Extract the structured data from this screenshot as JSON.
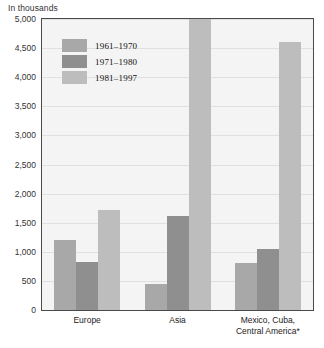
{
  "chart_data": {
    "type": "bar",
    "title": "In thousands",
    "xlabel": "",
    "ylabel": "In thousands",
    "ylim": [
      0,
      5000
    ],
    "ytick_labels": [
      "5,000",
      "4,500",
      "4,000",
      "3,500",
      "3,000",
      "2,500",
      "2,000",
      "1,500",
      "1,000",
      "500",
      "0"
    ],
    "ytick_values": [
      5000,
      4500,
      4000,
      3500,
      3000,
      2500,
      2000,
      1500,
      1000,
      500,
      0
    ],
    "grid": true,
    "legend_position": "upper-left-inside",
    "categories": [
      "Europe",
      "Asia",
      "Mexico, Cuba,\nCentral America*"
    ],
    "series": [
      {
        "name": "1961–1970",
        "color": "#a8a8a8",
        "values": [
          1200,
          450,
          800
        ]
      },
      {
        "name": "1971–1980",
        "color": "#8f8f8f",
        "values": [
          820,
          1620,
          1050
        ]
      },
      {
        "name": "1981–1997",
        "color": "#bdbdbd",
        "values": [
          1720,
          5000,
          4600
        ]
      }
    ]
  },
  "legend": {
    "items": [
      {
        "label": "1961–1970"
      },
      {
        "label": "1971–1980"
      },
      {
        "label": "1981–1997"
      }
    ]
  }
}
